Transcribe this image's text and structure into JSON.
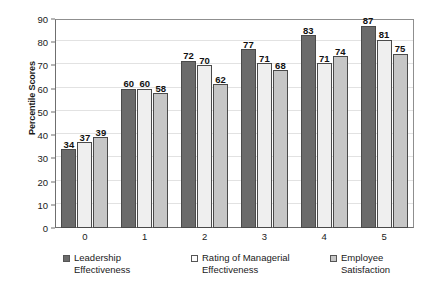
{
  "chart_data": {
    "type": "bar",
    "title": "",
    "xlabel": "",
    "ylabel": "Percentile Scores",
    "categories": [
      "0",
      "1",
      "2",
      "3",
      "4",
      "5"
    ],
    "series": [
      {
        "name": "Leadership Effectiveness",
        "values": [
          34,
          60,
          72,
          77,
          83,
          87
        ],
        "color": "#6b6b6b"
      },
      {
        "name": "Rating of Managerial Effectiveness",
        "values": [
          37,
          60,
          70,
          71,
          71,
          81
        ],
        "color": "#efefef"
      },
      {
        "name": "Employee Satisfaction",
        "values": [
          39,
          58,
          62,
          68,
          74,
          75
        ],
        "color": "#c6c6c6"
      }
    ],
    "ylim": [
      0,
      90
    ],
    "yticks": [
      0,
      10,
      20,
      30,
      40,
      50,
      60,
      70,
      80,
      90
    ],
    "ytick_labels": [
      "0",
      "10",
      "20",
      "30",
      "40",
      "50",
      "60",
      "70",
      "80",
      "90"
    ],
    "grid": true,
    "data_labels": true,
    "legend_position": "bottom"
  },
  "legend": {
    "items": [
      {
        "label": "Leadership\nEffectiveness"
      },
      {
        "label": "Rating of Managerial\nEffectiveness"
      },
      {
        "label": "Employee\nSatisfaction"
      }
    ]
  }
}
